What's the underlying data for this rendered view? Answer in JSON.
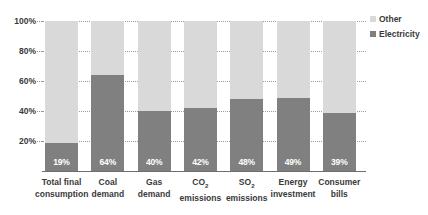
{
  "chart_data": {
    "type": "bar",
    "subtype": "stacked-100-percent",
    "title": "",
    "xlabel": "",
    "ylabel": "",
    "ylim": [
      0,
      100
    ],
    "ytick_labels": [
      "20%",
      "40%",
      "60%",
      "80%",
      "100%"
    ],
    "ytick_values": [
      20,
      40,
      60,
      80,
      100
    ],
    "grid": true,
    "legend_position": "right",
    "categories": [
      "Total final consumption",
      "Coal demand",
      "Gas demand",
      "CO2 emissions",
      "SO2 emissions",
      "Energy investment",
      "Consumer bills"
    ],
    "category_lines": [
      [
        "Total final",
        "consumption"
      ],
      [
        "Coal",
        "demand"
      ],
      [
        "Gas",
        "demand"
      ],
      [
        "CO",
        "emissions"
      ],
      [
        "SO",
        "emissions"
      ],
      [
        "Energy",
        "investment"
      ],
      [
        "Consumer",
        "bills"
      ]
    ],
    "series": [
      {
        "name": "Electricity",
        "color": "#808080",
        "values": [
          19,
          64,
          40,
          42,
          48,
          49,
          39
        ],
        "data_labels": [
          "19%",
          "64%",
          "40%",
          "42%",
          "48%",
          "49%",
          "39%"
        ]
      },
      {
        "name": "Other",
        "color": "#d9d9d9",
        "values": [
          81,
          36,
          60,
          58,
          52,
          51,
          61
        ],
        "data_labels": [
          "",
          "",
          "",
          "",
          "",
          "",
          ""
        ]
      }
    ]
  },
  "legend": {
    "items": [
      {
        "label": "Other",
        "color": "#d9d9d9"
      },
      {
        "label": "Electricity",
        "color": "#808080"
      }
    ]
  },
  "axis": {
    "ticks": [
      {
        "label": "100%",
        "value": 100
      },
      {
        "label": "80%",
        "value": 80
      },
      {
        "label": "60%",
        "value": 60
      },
      {
        "label": "40%",
        "value": 40
      },
      {
        "label": "20%",
        "value": 20
      }
    ]
  }
}
